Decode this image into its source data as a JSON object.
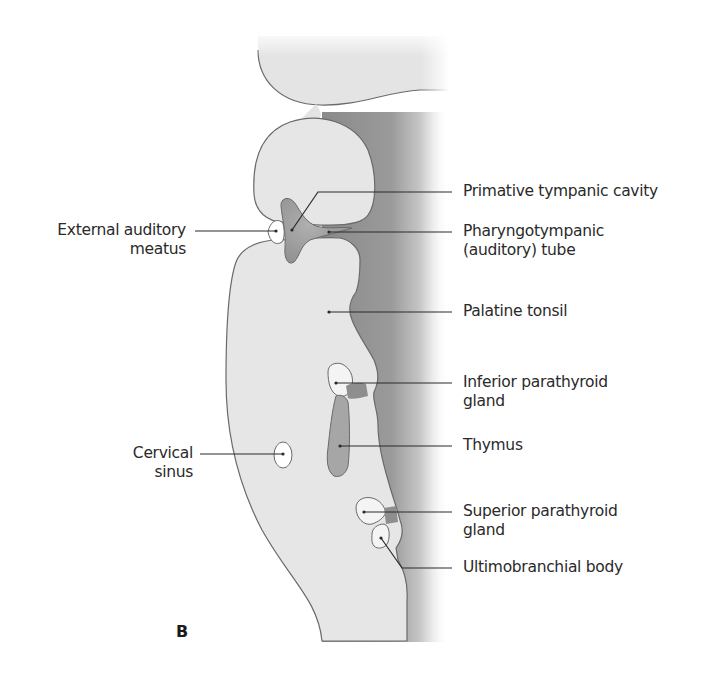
{
  "figure": {
    "panel_letter": "B",
    "colors": {
      "tissue_fill": "#e6e6e6",
      "outline": "#6a6a6a",
      "shadow_dark": "#8c8c8c",
      "pouch_fill": "#9a9a9a",
      "cavity_fill": "#ffffff",
      "leader_line": "#2a2a2a",
      "text": "#2a2a2a"
    }
  },
  "labels": {
    "left": [
      {
        "id": "external-auditory-meatus",
        "line1": "External auditory",
        "line2": "meatus"
      },
      {
        "id": "cervical-sinus",
        "line1": "Cervical",
        "line2": "sinus"
      }
    ],
    "right": [
      {
        "id": "primative-tympanic-cavity",
        "line1": "Primative tympanic cavity",
        "line2": ""
      },
      {
        "id": "pharyngotympanic-tube",
        "line1": "Pharyngotympanic",
        "line2": "(auditory) tube"
      },
      {
        "id": "palatine-tonsil",
        "line1": "Palatine tonsil",
        "line2": ""
      },
      {
        "id": "inferior-parathyroid-gland",
        "line1": "Inferior parathyroid",
        "line2": "gland"
      },
      {
        "id": "thymus",
        "line1": "Thymus",
        "line2": ""
      },
      {
        "id": "superior-parathyroid-gland",
        "line1": "Superior parathyroid",
        "line2": "gland"
      },
      {
        "id": "ultimobranchial-body",
        "line1": "Ultimobranchial body",
        "line2": ""
      }
    ]
  }
}
